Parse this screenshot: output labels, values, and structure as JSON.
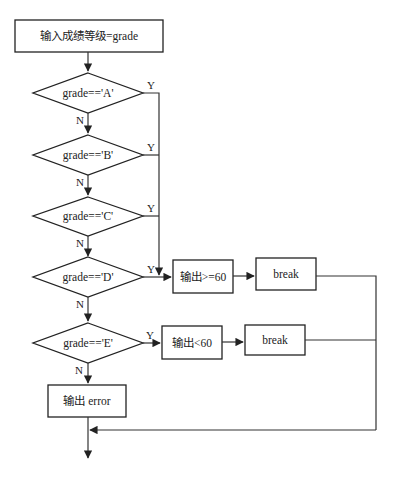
{
  "flowchart": {
    "start": {
      "label": "输入成绩等级=grade"
    },
    "decisions": [
      {
        "id": "A",
        "label": "grade=='A'",
        "yes": "Y",
        "no": "N"
      },
      {
        "id": "B",
        "label": "grade=='B'",
        "yes": "Y",
        "no": "N"
      },
      {
        "id": "C",
        "label": "grade=='C'",
        "yes": "Y",
        "no": "N"
      },
      {
        "id": "D",
        "label": "grade=='D'",
        "yes": "Y",
        "no": "N"
      },
      {
        "id": "E",
        "label": "grade=='E'",
        "yes": "Y",
        "no": "N"
      }
    ],
    "pass_output": {
      "label": "输出>=60"
    },
    "pass_break": {
      "label": "break"
    },
    "fail_output": {
      "label": "输出<60"
    },
    "fail_break": {
      "label": "break"
    },
    "error_output": {
      "label": "输出 error"
    }
  }
}
